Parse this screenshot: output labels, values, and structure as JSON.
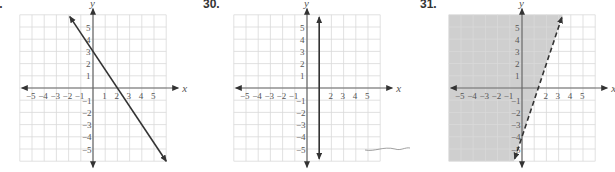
{
  "chart_data": [
    {
      "type": "line",
      "problem_number": "29.",
      "title": "",
      "xlabel": "x",
      "ylabel": "y",
      "xlim": [
        -6,
        6
      ],
      "ylim": [
        -6,
        6
      ],
      "x_ticks": [
        -5,
        -4,
        -3,
        -2,
        -1,
        1,
        2,
        3,
        4,
        5
      ],
      "y_ticks": [
        5,
        4,
        3,
        2,
        1,
        -1,
        -2,
        -3,
        -4,
        -5
      ],
      "grid": true,
      "series": [
        {
          "name": "line",
          "style": "solid",
          "equation": "y = -3/2 x + 3",
          "points": [
            [
              -1.9,
              5.85
            ],
            [
              0,
              3
            ],
            [
              2,
              0
            ],
            [
              6,
              -6
            ]
          ]
        }
      ],
      "shading": null
    },
    {
      "type": "line",
      "problem_number": "30.",
      "title": "",
      "xlabel": "x",
      "ylabel": "y",
      "xlim": [
        -6,
        6
      ],
      "ylim": [
        -6,
        6
      ],
      "x_ticks": [
        -5,
        -4,
        -3,
        -2,
        -1,
        2,
        3,
        4,
        5
      ],
      "y_ticks": [
        5,
        4,
        3,
        2,
        1,
        -1,
        -2,
        -3,
        -4,
        -5
      ],
      "grid": true,
      "series": [
        {
          "name": "line",
          "style": "solid",
          "equation": "x = 1",
          "points": [
            [
              1,
              5.8
            ],
            [
              1,
              -5.8
            ]
          ]
        }
      ],
      "shading": null
    },
    {
      "type": "area",
      "problem_number": "31.",
      "title": "",
      "xlabel": "x",
      "ylabel": "y",
      "xlim": [
        -6,
        6
      ],
      "ylim": [
        -6,
        6
      ],
      "x_ticks": [
        -5,
        -4,
        -3,
        -2,
        -1,
        2,
        3,
        4,
        5
      ],
      "y_ticks": [
        5,
        4,
        3,
        2,
        1,
        -1,
        -2,
        -3,
        -4,
        -5
      ],
      "grid": true,
      "series": [
        {
          "name": "boundary",
          "style": "dashed",
          "equation": "y = 3x - 4",
          "points": [
            [
              -0.6,
              -5.8
            ],
            [
              0,
              -4
            ],
            [
              1.33,
              0
            ],
            [
              3.27,
              5.8
            ]
          ]
        }
      ],
      "shading": {
        "region": "y > 3x - 4",
        "side": "left",
        "color": "#cfcfcf"
      }
    }
  ],
  "labels": {
    "p1": "29.",
    "p2": "30.",
    "p3": "31.",
    "x": "x",
    "y": "y"
  },
  "colors": {
    "grid": "#d9d9d9",
    "axis": "#666666",
    "line": "#333333",
    "shade": "#cfcfcf",
    "tick_text": "#555555"
  }
}
